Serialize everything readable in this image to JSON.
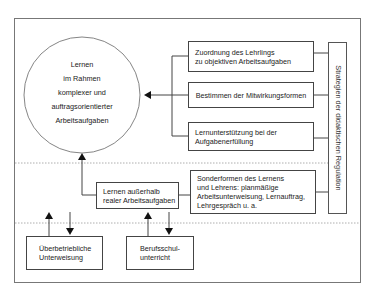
{
  "circle": {
    "lines": [
      "Lernen",
      "im Rahmen",
      "komplexer und",
      "auftragsorientierter",
      "Arbeitsaufgaben"
    ]
  },
  "boxes": {
    "zuordnung": [
      "Zuordnung des Lehrlings",
      "zu objektiven Arbeitsaufgaben"
    ],
    "bestimmen": [
      "Bestimmen der Mitwirkungsformen"
    ],
    "lernunterstuetzung": [
      "Lernunterstützung bei der",
      "Aufgabenerfüllung"
    ],
    "ausserhalb": [
      "Lernen außerhalb",
      "realer Arbeitsaufgaben"
    ],
    "sonderformen": [
      "Sonderformen des Lernens",
      "und Lehrens: planmäßige",
      "Arbeitsunterweisung, Lernauftrag,",
      "Lehrgespräch u. a."
    ],
    "ueberbetrieblich": [
      "Überbetriebliche",
      "Unterweisung"
    ],
    "berufsschule": [
      "Berufsschul-",
      "unterricht"
    ]
  },
  "vertical_label": "Strategien der didaktischen Regulation",
  "colors": {
    "line": "#444444",
    "dotted": "#999999"
  }
}
